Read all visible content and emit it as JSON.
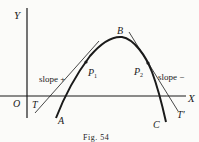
{
  "figure": {
    "caption": "Fig. 54",
    "axes": {
      "x_label": "X",
      "y_label": "Y",
      "origin_label": "O"
    },
    "points": {
      "A": "A",
      "B": "B",
      "C": "C",
      "P1": "P",
      "P1_sub": "1",
      "P2": "P",
      "P2_sub": "2"
    },
    "tangents": {
      "left_label": "T",
      "right_label": "T′"
    },
    "annotations": {
      "slope_positive": "slope +",
      "slope_negative": "slope −"
    },
    "colors": {
      "ink": "#1a1a1a",
      "paper": "#fbfbf9"
    }
  }
}
